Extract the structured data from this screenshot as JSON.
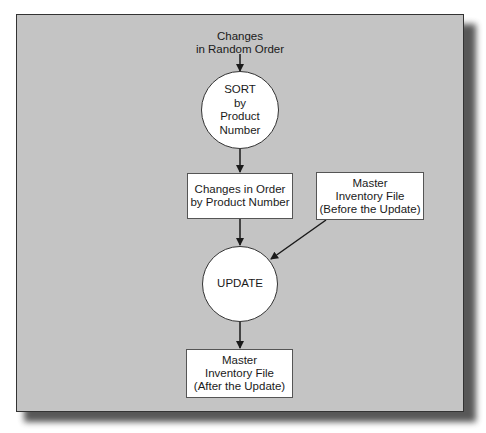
{
  "diagram": {
    "input_label": {
      "line1": "Changes",
      "line2": "in Random Order"
    },
    "sort_process": {
      "line1": "SORT",
      "line2": "by",
      "line3": "Product",
      "line4": "Number"
    },
    "sorted_changes": {
      "line1": "Changes in Order",
      "line2": "by Product Number"
    },
    "master_before": {
      "line1": "Master",
      "line2": "Inventory File",
      "line3": "(Before the Update)"
    },
    "update_process": {
      "label": "UPDATE"
    },
    "master_after": {
      "line1": "Master",
      "line2": "Inventory File",
      "line3": "(After the Update)"
    }
  },
  "colors": {
    "panel": "#c4c4c4",
    "node_fill": "#ffffff",
    "stroke": "#1a1a1a"
  }
}
